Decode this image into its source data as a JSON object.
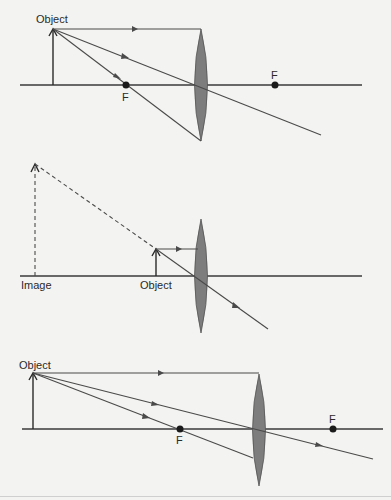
{
  "figure": {
    "colors": {
      "background": "#f3f3f1",
      "lens_fill": "#7d7d7d",
      "line": "#4a4a4a",
      "focal_point": "#1a1a1a"
    }
  },
  "diagrams": [
    {
      "id": "object-beyond-F",
      "labels": {
        "object": "Object",
        "focal_left": "F",
        "focal_right": "F"
      }
    },
    {
      "id": "object-inside-F-virtual-image",
      "labels": {
        "image": "Image",
        "object": "Object"
      }
    },
    {
      "id": "object-beyond-F-far",
      "labels": {
        "object": "Object",
        "focal_left": "F",
        "focal_right": "F"
      }
    }
  ]
}
